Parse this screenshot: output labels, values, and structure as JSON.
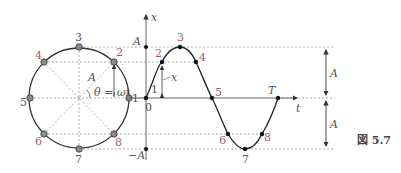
{
  "figure": {
    "caption": "図 5.7",
    "colors": {
      "curve": "#333333",
      "dashed": "#999999",
      "point_fill": "#8a8a8a",
      "label": "#555555",
      "label_accent": "#a0606a"
    }
  },
  "circle": {
    "center_label": "",
    "radius_label": "A",
    "angle_label": "θ = ωt",
    "points": [
      {
        "id": "1",
        "label": "1"
      },
      {
        "id": "2",
        "label": "2"
      },
      {
        "id": "3",
        "label": "3"
      },
      {
        "id": "4",
        "label": "4"
      },
      {
        "id": "5",
        "label": "5"
      },
      {
        "id": "6",
        "label": "6"
      },
      {
        "id": "7",
        "label": "7"
      },
      {
        "id": "8",
        "label": "8"
      }
    ]
  },
  "graph": {
    "y_axis_label": "x",
    "x_axis_label": "t",
    "origin_label": "0",
    "pos_amplitude_label": "A",
    "neg_amplitude_label": "−A",
    "displacement_label": "x",
    "period_label": "T",
    "points": [
      {
        "id": "1",
        "label": "1"
      },
      {
        "id": "2",
        "label": "2"
      },
      {
        "id": "3",
        "label": "3"
      },
      {
        "id": "4",
        "label": "4"
      },
      {
        "id": "5",
        "label": "5"
      },
      {
        "id": "6",
        "label": "6"
      },
      {
        "id": "7",
        "label": "7"
      },
      {
        "id": "8",
        "label": "8"
      }
    ]
  },
  "dimension": {
    "upper_label": "A",
    "lower_label": "A"
  }
}
